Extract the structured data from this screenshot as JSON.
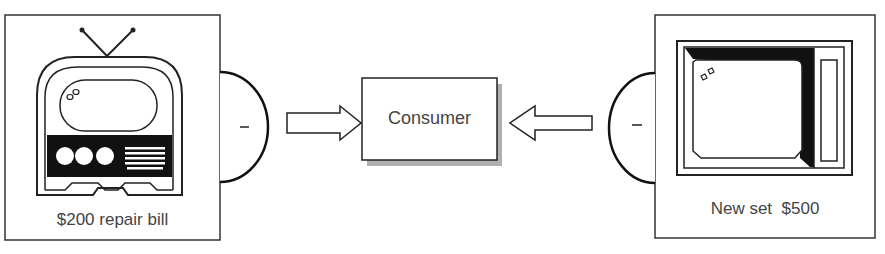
{
  "diagram": {
    "left_panel": {
      "label": "$200 repair bill",
      "icon": "old-tv-icon",
      "sign": "–"
    },
    "center": {
      "label": "Consumer"
    },
    "right_panel": {
      "label": "New set  $500",
      "icon": "new-tv-icon",
      "sign": "–"
    },
    "arrows": [
      {
        "from": "left_panel",
        "to": "center",
        "direction": "right"
      },
      {
        "from": "right_panel",
        "to": "center",
        "direction": "left"
      }
    ],
    "colors": {
      "line": "#222222",
      "shadow": "#aaaaaa",
      "text": "#444444"
    }
  }
}
